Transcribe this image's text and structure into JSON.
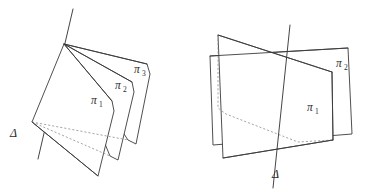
{
  "figure": {
    "background_color": "#ffffff",
    "stroke_color": "#3b3b3b",
    "hidden_stroke_color": "#8d8d8d",
    "label_color": "#2a2a2a",
    "width": 370,
    "height": 192
  },
  "left_diagram": {
    "name": "pencil-of-three-half-planes",
    "axis_label": {
      "symbol": "Δ",
      "x": 10,
      "y": 137
    },
    "plane_labels": [
      {
        "symbol": "π",
        "subscript": "1",
        "x": 91,
        "y": 104
      },
      {
        "symbol": "π",
        "subscript": "2",
        "x": 115,
        "y": 89
      },
      {
        "symbol": "π",
        "subscript": "3",
        "x": 134,
        "y": 73
      }
    ],
    "axis_endpoints": {
      "x1": 73,
      "y1": 9,
      "x2": 38,
      "y2": 159
    },
    "apex": {
      "x": 64,
      "y": 44
    },
    "hinge": {
      "x": 32,
      "y": 122
    }
  },
  "right_diagram": {
    "name": "two-planes-crossing-along-line",
    "axis_label": {
      "symbol": "Δ",
      "x": 272,
      "y": 178
    },
    "plane_labels": [
      {
        "symbol": "π",
        "subscript": "1",
        "x": 307,
        "y": 111
      },
      {
        "symbol": "π",
        "subscript": "2",
        "x": 336,
        "y": 67
      }
    ],
    "axis_endpoints": {
      "x1": 290,
      "y1": 25,
      "x2": 273,
      "y2": 188
    },
    "crossing_point": {
      "x": 298,
      "y": 54
    }
  }
}
